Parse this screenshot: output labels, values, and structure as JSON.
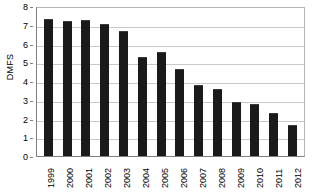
{
  "chart_data": {
    "type": "bar",
    "title": "",
    "xlabel": "",
    "ylabel": "DMFS",
    "categories": [
      "1999",
      "2000",
      "2001",
      "2002",
      "2003",
      "2004",
      "2005",
      "2006",
      "2007",
      "2008",
      "2009",
      "2010",
      "2011",
      "2012"
    ],
    "values": [
      7.3,
      7.2,
      7.25,
      7.05,
      6.65,
      5.3,
      5.55,
      4.65,
      3.8,
      3.55,
      2.9,
      2.8,
      2.3,
      1.65
    ],
    "ylim": [
      0,
      8
    ],
    "ytick_labels": [
      "8",
      "7",
      "6",
      "5",
      "4",
      "3",
      "2",
      "1",
      "0"
    ],
    "ytick_values": [
      8,
      7,
      6,
      5,
      4,
      3,
      2,
      1,
      0
    ],
    "grid": true,
    "grid_axis": "y",
    "legend": false,
    "legend_position": "none",
    "bar_color": "#1a1a1a",
    "plot_background": "#ffffff",
    "gridline_color": "#c9c9c9",
    "axis_color": "#7f7f7f",
    "xtick_rotation": -90
  }
}
